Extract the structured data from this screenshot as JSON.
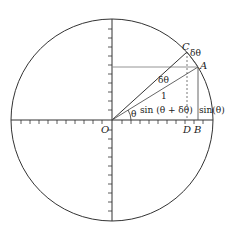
{
  "diagram": {
    "colors": {
      "stroke": "#333333",
      "light_stroke": "#888888",
      "background": "#ffffff"
    },
    "labels": {
      "origin": "O",
      "point_c": "C",
      "point_a": "A",
      "point_d": "D",
      "point_b": "B",
      "delta_theta_arc": "δθ",
      "delta_theta_angle": "δθ",
      "radius": "1",
      "theta": "θ",
      "sin_theta_plus_delta": "sin (θ + δθ)",
      "sin_theta": "sin(θ)"
    }
  }
}
